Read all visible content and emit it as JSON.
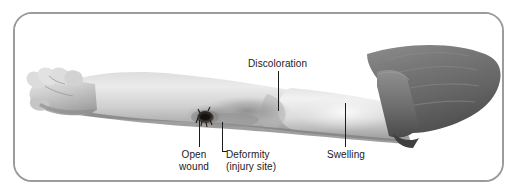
{
  "figure": {
    "frame_color": "#9b9b9b",
    "background_color": "#ffffff",
    "leader_line_color": "#1c1c1c",
    "label_text_color": "#1a1a1a"
  },
  "labels": [
    {
      "id": "discoloration",
      "text": "Discoloration",
      "points_to": "mid forearm bruised area"
    },
    {
      "id": "open_wound",
      "text": "Open\nwound",
      "points_to": "dark irregular wound on forearm"
    },
    {
      "id": "deformity",
      "text": "Deformity\n(injury site)",
      "points_to": "angulation of the forearm"
    },
    {
      "id": "swelling",
      "text": "Swelling",
      "points_to": "enlarged upper forearm / elbow region"
    }
  ],
  "anatomy": {
    "hand": "relaxed curled fingers at left",
    "forearm": "light gray skin with darker shaded underside",
    "wound": "dark irregular open wound",
    "sleeve": "dark gray rolled-up shirt sleeve at upper right",
    "sleeve_color": "#6e6e6e",
    "skin_light": "#e8e8e8",
    "skin_mid": "#c2c2c2",
    "skin_shadow": "#8f8f8f",
    "wound_color": "#23201e"
  }
}
